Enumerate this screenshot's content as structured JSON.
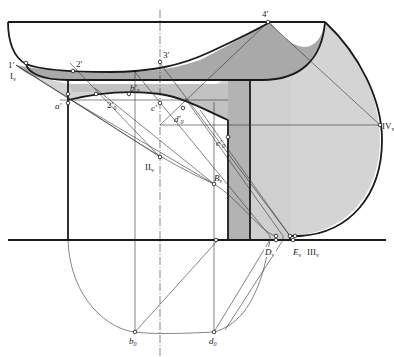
{
  "diagram": {
    "type": "descriptive-geometry shadow construction",
    "colors": {
      "background": "#ffffff",
      "line": "#1a1a1a",
      "shade_dark": "#a8a8a8",
      "shade_mid": "#bdbdbd",
      "shade_light": "#d6d6d6",
      "shade_column": "#b0b0b0"
    },
    "labels": {
      "p1": "1′",
      "p1v": "I",
      "p1v_sub": "v",
      "p2": "2′",
      "p3": "3′",
      "p4": "4′",
      "a": "a′",
      "b0p": "b′",
      "b0p_sub": "0",
      "two0": "2′",
      "two0_sub": "0",
      "c": "c′",
      "d0p": "d′",
      "d0p_sub": "0",
      "e0p": "e′",
      "e0p_sub": "0",
      "IIv": "II",
      "IIv_sub": "v",
      "Bv": "B",
      "Bv_sub": "v",
      "IVv": "IV",
      "IVv_sub": "v",
      "Dv": "D",
      "Dv_sub": "v",
      "Ev": "E",
      "Ev_sub": "v",
      "IIIv": "III",
      "IIIv_sub": "v",
      "b0": "b",
      "b0_sub": "0",
      "d0": "d",
      "d0_sub": "0"
    }
  }
}
